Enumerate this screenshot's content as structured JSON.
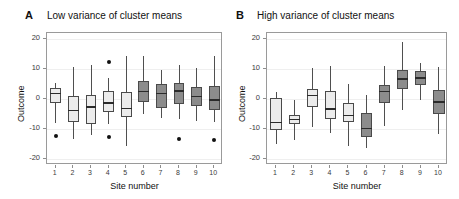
{
  "figure": {
    "axis": {
      "ylabel": "Outcome",
      "xlabel": "Site number",
      "yticks": [
        "20",
        "10",
        "0",
        "-10",
        "-20"
      ],
      "ytick_values": [
        20,
        10,
        0,
        -10,
        -20
      ],
      "xticks": [
        "1",
        "2",
        "3",
        "4",
        "5",
        "6",
        "7",
        "8",
        "9",
        "10"
      ],
      "ylim": [
        -22,
        22
      ]
    },
    "colors": {
      "box_light": "#ececec",
      "box_dark": "#8c8c8c",
      "outline": "#4a4a4a",
      "median": "#2b2b2b",
      "grid": "#efefef",
      "panel_border": "#9a9a9a",
      "text": "#111111"
    },
    "panels": [
      {
        "letter": "A",
        "title": "Low variance of cluster means"
      },
      {
        "letter": "B",
        "title": "High variance of cluster means"
      }
    ]
  },
  "chart_data": [
    {
      "type": "box",
      "title": "Low variance of cluster means",
      "panel_letter": "A",
      "xlabel": "Site number",
      "ylabel": "Outcome",
      "ylim": [
        -22,
        22
      ],
      "yticks": [
        20,
        10,
        0,
        -10,
        -20
      ],
      "grid": true,
      "legend": "none",
      "categories": [
        "1",
        "2",
        "3",
        "4",
        "5",
        "6",
        "7",
        "8",
        "9",
        "10"
      ],
      "fills": [
        "light",
        "light",
        "light",
        "light",
        "light",
        "dark",
        "dark",
        "dark",
        "dark",
        "dark"
      ],
      "boxes": [
        {
          "site": 1,
          "whisker_low": -7.9,
          "q1": -1.2,
          "median": 1.8,
          "q3": 3.7,
          "whisker_high": 5.2,
          "outliers": [
            -12.3
          ]
        },
        {
          "site": 2,
          "whisker_low": -13.2,
          "q1": -7.8,
          "median": -3.9,
          "q3": 0.9,
          "whisker_high": 10.6,
          "outliers": []
        },
        {
          "site": 3,
          "whisker_low": -12.0,
          "q1": -8.2,
          "median": -2.6,
          "q3": 1.2,
          "whisker_high": 11.3,
          "outliers": []
        },
        {
          "site": 4,
          "whisker_low": -8.4,
          "q1": -4.4,
          "median": -1.3,
          "q3": 2.6,
          "whisker_high": 7.0,
          "outliers": [
            12.4,
            -12.8
          ]
        },
        {
          "site": 5,
          "whisker_low": -15.8,
          "q1": -6.1,
          "median": -3.2,
          "q3": 2.5,
          "whisker_high": 14.5,
          "outliers": []
        },
        {
          "site": 6,
          "whisker_low": -5.0,
          "q1": -1.1,
          "median": 2.5,
          "q3": 6.1,
          "whisker_high": 14.3,
          "outliers": []
        },
        {
          "site": 7,
          "whisker_low": -6.3,
          "q1": -3.0,
          "median": 1.9,
          "q3": 4.9,
          "whisker_high": 9.8,
          "outliers": []
        },
        {
          "site": 8,
          "whisker_low": -6.6,
          "q1": -1.6,
          "median": 2.6,
          "q3": 5.3,
          "whisker_high": 11.3,
          "outliers": [
            -13.4
          ]
        },
        {
          "site": 9,
          "whisker_low": -7.3,
          "q1": -2.3,
          "median": 0.9,
          "q3": 4.1,
          "whisker_high": 10.2,
          "outliers": []
        },
        {
          "site": 10,
          "whisker_low": -7.8,
          "q1": -3.7,
          "median": -0.4,
          "q3": 4.2,
          "whisker_high": 14.5,
          "outliers": [
            -13.7
          ]
        }
      ]
    },
    {
      "type": "box",
      "title": "High variance of cluster means",
      "panel_letter": "B",
      "xlabel": "Site number",
      "ylabel": "Outcome",
      "ylim": [
        -22,
        22
      ],
      "yticks": [
        20,
        10,
        0,
        -10,
        -20
      ],
      "grid": true,
      "legend": "none",
      "categories": [
        "1",
        "2",
        "3",
        "4",
        "5",
        "6",
        "7",
        "8",
        "9",
        "10"
      ],
      "fills": [
        "light",
        "light",
        "light",
        "light",
        "light",
        "dark",
        "dark",
        "dark",
        "dark",
        "dark"
      ],
      "boxes": [
        {
          "site": 1,
          "whisker_low": -14.9,
          "q1": -10.4,
          "median": -7.9,
          "q3": 0.2,
          "whisker_high": 2.4,
          "outliers": []
        },
        {
          "site": 2,
          "whisker_low": -13.8,
          "q1": -8.3,
          "median": -6.8,
          "q3": -5.3,
          "whisker_high": -0.3,
          "outliers": []
        },
        {
          "site": 3,
          "whisker_low": -9.3,
          "q1": -2.6,
          "median": 1.2,
          "q3": 3.2,
          "whisker_high": 10.5,
          "outliers": []
        },
        {
          "site": 4,
          "whisker_low": -11.3,
          "q1": -6.6,
          "median": -3.3,
          "q3": 2.6,
          "whisker_high": 11.0,
          "outliers": []
        },
        {
          "site": 5,
          "whisker_low": -15.6,
          "q1": -7.8,
          "median": -5.5,
          "q3": -1.2,
          "whisker_high": 5.1,
          "outliers": []
        },
        {
          "site": 6,
          "whisker_low": -16.3,
          "q1": -12.6,
          "median": -9.8,
          "q3": -4.6,
          "whisker_high": 1.2,
          "outliers": []
        },
        {
          "site": 7,
          "whisker_low": -9.1,
          "q1": -1.3,
          "median": 2.5,
          "q3": 4.7,
          "whisker_high": 11.1,
          "outliers": []
        },
        {
          "site": 8,
          "whisker_low": -3.6,
          "q1": 3.4,
          "median": 6.7,
          "q3": 9.8,
          "whisker_high": 19.1,
          "outliers": []
        },
        {
          "site": 9,
          "whisker_low": -0.5,
          "q1": 4.7,
          "median": 7.0,
          "q3": 9.4,
          "whisker_high": 11.9,
          "outliers": []
        },
        {
          "site": 10,
          "whisker_low": -11.7,
          "q1": -5.0,
          "median": -1.0,
          "q3": 2.9,
          "whisker_high": 10.8,
          "outliers": []
        }
      ]
    }
  ]
}
